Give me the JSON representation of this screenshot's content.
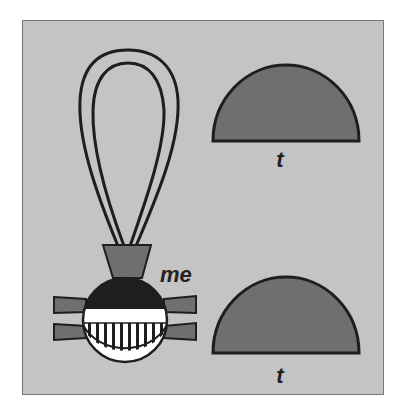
{
  "figure": {
    "background_color": "#c4c4c4",
    "fill_dark_gray": "#6f6f6f",
    "fill_black": "#1e1e1e",
    "fill_white": "#ffffff",
    "labels": {
      "me": "me",
      "t_upper": "t",
      "t_lower": "t"
    },
    "glyphs": [
      {
        "name": "loop-with-vessel",
        "label": "me"
      },
      {
        "name": "semicircle-upper",
        "label": "t"
      },
      {
        "name": "semicircle-lower",
        "label": "t"
      }
    ]
  }
}
